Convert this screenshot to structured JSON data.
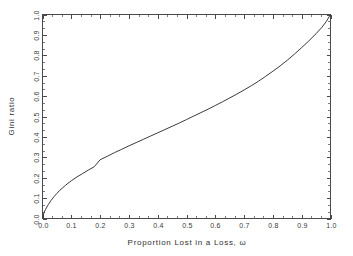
{
  "chart_data": {
    "type": "line",
    "title": "",
    "xlabel": "Proportion Lost in a Loss, ω",
    "ylabel": "Gini ratio",
    "xlim": [
      0.0,
      1.0
    ],
    "ylim": [
      0.0,
      1.0
    ],
    "grid": false,
    "legend": null,
    "xticks": [
      "0.0",
      "0.1",
      "0.2",
      "0.3",
      "0.4",
      "0.5",
      "0.6",
      "0.7",
      "0.8",
      "0.9",
      "1.0"
    ],
    "xtick_values": [
      0.0,
      0.1,
      0.2,
      0.3,
      0.4,
      0.5,
      0.6,
      0.7,
      0.8,
      0.9,
      1.0
    ],
    "yticks": [
      "0.0",
      "0.1",
      "0.2",
      "0.3",
      "0.4",
      "0.5",
      "0.6",
      "0.7",
      "0.8",
      "0.9",
      "1.0"
    ],
    "ytick_values": [
      0.0,
      0.1,
      0.2,
      0.3,
      0.4,
      0.5,
      0.6,
      0.7,
      0.8,
      0.9,
      1.0
    ],
    "minor_ticks_per_interval": 2,
    "series": [
      {
        "name": "Gini ratio",
        "color": "#3a3a3a",
        "x": [
          0.0,
          0.005,
          0.01,
          0.02,
          0.03,
          0.04,
          0.05,
          0.06,
          0.08,
          0.1,
          0.12,
          0.14,
          0.16,
          0.18,
          0.2,
          0.225,
          0.25,
          0.275,
          0.3,
          0.325,
          0.35,
          0.375,
          0.4,
          0.425,
          0.45,
          0.475,
          0.5,
          0.525,
          0.55,
          0.575,
          0.6,
          0.625,
          0.65,
          0.675,
          0.7,
          0.725,
          0.75,
          0.775,
          0.8,
          0.825,
          0.85,
          0.875,
          0.9,
          0.925,
          0.95,
          0.97,
          0.985,
          1.0
        ],
        "y": [
          0.0,
          0.028,
          0.043,
          0.068,
          0.089,
          0.107,
          0.123,
          0.138,
          0.163,
          0.185,
          0.204,
          0.221,
          0.238,
          0.254,
          0.288,
          0.305,
          0.323,
          0.339,
          0.356,
          0.372,
          0.388,
          0.404,
          0.42,
          0.436,
          0.452,
          0.468,
          0.485,
          0.502,
          0.519,
          0.536,
          0.554,
          0.572,
          0.591,
          0.61,
          0.63,
          0.651,
          0.673,
          0.697,
          0.722,
          0.748,
          0.776,
          0.806,
          0.838,
          0.871,
          0.906,
          0.937,
          0.965,
          1.0
        ]
      }
    ],
    "annotations": []
  },
  "axes": {
    "x_title": "Proportion Lost in a Loss, ω",
    "y_title": "Gini ratio",
    "frame_color": "#4a4a4a"
  }
}
